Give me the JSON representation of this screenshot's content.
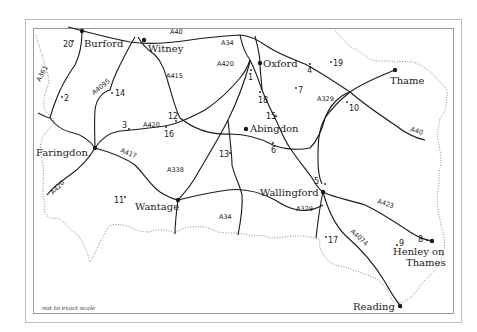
{
  "map": {
    "scale_note": "not to exact scale",
    "colors": {
      "road": "#1a1a1a",
      "boundary": "#8a8a8a",
      "frame": "#9a9a9a"
    },
    "towns": [
      {
        "name": "Burford",
        "x": 82,
        "y": 31
      },
      {
        "name": "Witney",
        "x": 144,
        "y": 40
      },
      {
        "name": "Oxford",
        "x": 260,
        "y": 63
      },
      {
        "name": "Thame",
        "x": 395,
        "y": 70
      },
      {
        "name": "Faringdon.",
        "x": 95,
        "y": 148
      },
      {
        "name": "Abingdon",
        "x": 246,
        "y": 129
      },
      {
        "name": "Wallingford",
        "x": 323,
        "y": 192
      },
      {
        "name": "Wantage",
        "x": 178,
        "y": 200
      },
      {
        "name": "Henley on",
        "x": 432,
        "y": 241
      },
      {
        "name": "Thames",
        "x": 432,
        "y": 241
      },
      {
        "name": "Reading",
        "x": 400,
        "y": 306
      }
    ],
    "points": [
      {
        "label": "1",
        "x": 251,
        "y": 73
      },
      {
        "label": "2",
        "x": 62,
        "y": 97
      },
      {
        "label": "3",
        "x": 129,
        "y": 128
      },
      {
        "label": "4",
        "x": 310,
        "y": 66
      },
      {
        "label": "5",
        "x": 322,
        "y": 184
      },
      {
        "label": "6",
        "x": 273,
        "y": 145
      },
      {
        "label": "7",
        "x": 296,
        "y": 89
      },
      {
        "label": "8",
        "x": 428,
        "y": 240
      },
      {
        "label": "9",
        "x": 397,
        "y": 244
      },
      {
        "label": "10",
        "x": 348,
        "y": 104
      },
      {
        "label": "11",
        "x": 124,
        "y": 198
      },
      {
        "label": "12",
        "x": 176,
        "y": 118
      },
      {
        "label": "13",
        "x": 230,
        "y": 153
      },
      {
        "label": "14",
        "x": 112,
        "y": 93
      },
      {
        "label": "15",
        "x": 274,
        "y": 116
      },
      {
        "label": "16",
        "x": 166,
        "y": 127
      },
      {
        "label": "17",
        "x": 326,
        "y": 238
      },
      {
        "label": "18",
        "x": 260,
        "y": 94
      },
      {
        "label": "19",
        "x": 333,
        "y": 62
      },
      {
        "label": "20",
        "x": 72,
        "y": 43
      }
    ],
    "roads": [
      "A40",
      "A34",
      "A420",
      "A361",
      "A4095",
      "A415",
      "A420",
      "A417",
      "A420",
      "A338",
      "A34",
      "A329",
      "A329",
      "A40",
      "A423",
      "A4074"
    ]
  },
  "labels": {
    "burford": "Burford",
    "witney": "Witney",
    "oxford": "Oxford",
    "thame": "Thame",
    "faringdon": "Faringdon.",
    "abingdon": "Abingdon",
    "wallingford": "Wallingford",
    "wantage": "Wantage",
    "henley1": "Henley on",
    "henley2": "Thames",
    "reading": "Reading",
    "n1": "1",
    "n2": "2",
    "n3": "3",
    "n4": "4",
    "n5": "5",
    "n6": "6",
    "n7": "7",
    "n8": "8",
    "n9": "9",
    "n10": "10",
    "n11": "11",
    "n12": "12",
    "n13": "13",
    "n14": "14",
    "n15": "15",
    "n16": "16",
    "n17": "17",
    "n18": "18",
    "n19": "19",
    "n20": "20",
    "r_a40_top": "A40",
    "r_a34_top": "A34",
    "r_a420_top": "A420",
    "r_a361": "A361",
    "r_a4095": "A4095",
    "r_a415": "A415",
    "r_a420_mid": "A420",
    "r_a417": "A417",
    "r_a420_sw": "A420",
    "r_a338": "A338",
    "r_a34_bot": "A34",
    "r_a329_top": "A329",
    "r_a329_bot": "A329",
    "r_a40_right": "A40",
    "r_a423": "A423",
    "r_a4074": "A4074"
  }
}
